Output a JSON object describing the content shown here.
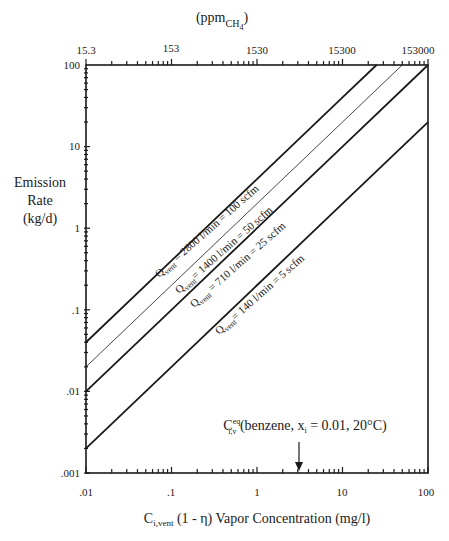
{
  "chart_data": {
    "type": "line",
    "title": "",
    "xlabel": "C_i,vent (1 - η)  Vapor Concentration (mg/l)",
    "xlabel_parts": {
      "main": "C",
      "sub": "i,vent",
      "rest": " (1 - η)  Vapor Concentration (mg/l)"
    },
    "ylabel": [
      "Emission",
      "Rate",
      "(kg/d)"
    ],
    "top_xlabel": {
      "main": "(ppm",
      "sub": "CH",
      "subsub": "4",
      "close": ")"
    },
    "x_scale": "log",
    "y_scale": "log",
    "xlim": [
      0.01,
      100
    ],
    "ylim": [
      0.001,
      100
    ],
    "x_ticks": [
      0.01,
      0.1,
      1,
      10,
      100
    ],
    "x_tick_labels": [
      ".01",
      ".1",
      "1",
      "10",
      "100"
    ],
    "y_ticks": [
      0.001,
      0.01,
      0.1,
      1,
      10,
      100
    ],
    "y_tick_labels": [
      ".001",
      ".01",
      ".1",
      "1",
      "10",
      "100"
    ],
    "top_x_tick_labels": [
      "15.3",
      "153",
      "1530",
      "15300",
      "153000"
    ],
    "grid": false,
    "legend": "inline line labels",
    "series": [
      {
        "name": "Q_vent = 2800 l/min = 100 scfm",
        "label_main": "Q",
        "label_sub": "vent",
        "label_rest": " = 2800 l/min = 100 scfm",
        "x": [
          0.01,
          0.1,
          1,
          10,
          25
        ],
        "values": [
          0.04,
          0.4,
          4,
          40,
          100
        ],
        "stroke": 1.8
      },
      {
        "name": "Q_vent = 1400 l/min = 50 scfm",
        "label_main": "Q",
        "label_sub": "vent",
        "label_rest": "= 1400 l/min = 50 scfm",
        "x": [
          0.01,
          0.1,
          1,
          10,
          50
        ],
        "values": [
          0.02,
          0.2,
          2,
          20,
          100
        ],
        "stroke": 0.8
      },
      {
        "name": "Q_vent = 710 l/min = 25 scfm",
        "label_main": "Q",
        "label_sub": "vent",
        "label_rest": " = 710 l/min = 25 scfm",
        "x": [
          0.01,
          0.1,
          1,
          10,
          100
        ],
        "values": [
          0.01,
          0.1,
          1,
          10,
          100
        ],
        "stroke": 1.8
      },
      {
        "name": "Q_vent = 140 l/min = 5 scfm",
        "label_main": "Q",
        "label_sub": "vent",
        "label_rest": "= 140 l/min = 5 scfm",
        "x": [
          0.01,
          0.1,
          1,
          10,
          100
        ],
        "values": [
          0.002,
          0.02,
          0.2,
          2,
          20
        ],
        "stroke": 1.8
      }
    ],
    "annotations": [
      {
        "text": "C^eq_i,v (benzene, x_i = 0.01, 20°C)",
        "main": "C",
        "sup": "eq",
        "sub": "i,v",
        "rest": " (benzene, x",
        "rest_sub": "i",
        "rest_end": " = 0.01, 20°C)",
        "arrow_x": 3.1,
        "points_to": "x-axis"
      }
    ]
  }
}
